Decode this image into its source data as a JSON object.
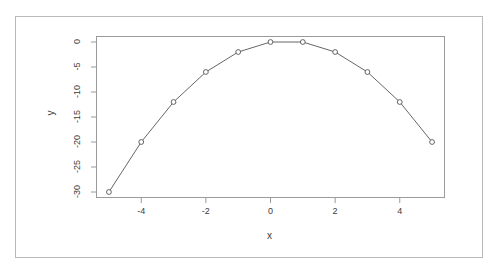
{
  "figure": {
    "background_color": "#ffffff",
    "frame_color": "#b9b9b9",
    "plot_box_color": "#9a9a9a",
    "line_color": "#555555",
    "marker_color": "#555555",
    "text_color": "#3c3c3c"
  },
  "chart_data": {
    "type": "line",
    "title": "",
    "subtitle": "",
    "xlabel": "x",
    "ylabel": "y",
    "x": [
      -5,
      -4,
      -3,
      -2,
      -1,
      0,
      1,
      2,
      3,
      4,
      5
    ],
    "values": [
      -30,
      -20,
      -12,
      -6,
      -2,
      0,
      0,
      -2,
      -6,
      -12,
      -20
    ],
    "series": [
      {
        "name": "y",
        "x": [
          -5,
          -4,
          -3,
          -2,
          -1,
          0,
          1,
          2,
          3,
          4,
          5
        ],
        "values": [
          -30,
          -20,
          -12,
          -6,
          -2,
          0,
          0,
          -2,
          -6,
          -12,
          -20
        ]
      }
    ],
    "xlim": [
      -5.4,
      5.4
    ],
    "ylim": [
      -31.2,
      1.2
    ],
    "xticks": [
      -4,
      -2,
      0,
      2,
      4
    ],
    "xtick_labels": [
      "-4",
      "-2",
      "0",
      "2",
      "4"
    ],
    "yticks": [
      0,
      -5,
      -10,
      -15,
      -20,
      -25,
      -30
    ],
    "ytick_labels": [
      "0",
      "-5",
      "-10",
      "-15",
      "-20",
      "-25",
      "-30"
    ],
    "grid": false,
    "legend": null,
    "legend_position": "none",
    "marker": "open-circle",
    "line_style": "solid",
    "annotations": []
  }
}
